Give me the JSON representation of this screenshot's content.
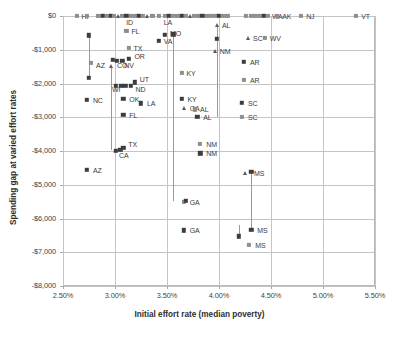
{
  "chart_data": {
    "type": "scatter",
    "title": "",
    "xlabel": "Initial effort rate (median poverty)",
    "ylabel": "Spending gap at varied effort rates",
    "xlim": [
      0.025,
      0.055
    ],
    "ylim": [
      -8000,
      0
    ],
    "xticks": [
      "2.50%",
      "3.00%",
      "3.50%",
      "4.00%",
      "4.50%",
      "5.00%",
      "5.50%"
    ],
    "xtick_values": [
      0.025,
      0.03,
      0.035,
      0.04,
      0.045,
      0.05,
      0.055
    ],
    "yticks": [
      "$0",
      "-$1,000",
      "-$2,000",
      "-$3,000",
      "-$4,000",
      "-$5,000",
      "-$6,000",
      "-$7,000",
      "-$8,000"
    ],
    "ytick_values": [
      0,
      -1000,
      -2000,
      -3000,
      -4000,
      -5000,
      -6000,
      -7000,
      -8000
    ],
    "grid": true,
    "legend": "none",
    "series": [
      {
        "name": "diamond-series",
        "marker": "diamond",
        "color": "#3d3d3d"
      },
      {
        "name": "square-series",
        "marker": "square",
        "color": "#8e8e8e"
      },
      {
        "name": "triangle-series",
        "marker": "triangle",
        "color": "#5a5a5a"
      }
    ],
    "points": [
      {
        "label": "HI",
        "x": 0.0263,
        "y": 0,
        "marker": "square",
        "lx": 5,
        "ly": 0
      },
      {
        "label": "",
        "x": 0.0273,
        "y": 0,
        "marker": "square"
      },
      {
        "label": "",
        "x": 0.0284,
        "y": 0,
        "marker": "square"
      },
      {
        "label": "",
        "x": 0.0288,
        "y": 0,
        "marker": "diamond"
      },
      {
        "label": "",
        "x": 0.0292,
        "y": 0,
        "marker": "square"
      },
      {
        "label": "",
        "x": 0.0296,
        "y": 0,
        "marker": "diamond"
      },
      {
        "label": "",
        "x": 0.0299,
        "y": 0,
        "marker": "square"
      },
      {
        "label": "",
        "x": 0.0303,
        "y": 0,
        "marker": "triangle"
      },
      {
        "label": "ID",
        "x": 0.0307,
        "y": 0,
        "marker": "square",
        "lx": 4,
        "ly": 6
      },
      {
        "label": "",
        "x": 0.0311,
        "y": 0,
        "marker": "diamond"
      },
      {
        "label": "",
        "x": 0.0315,
        "y": 0,
        "marker": "square"
      },
      {
        "label": "",
        "x": 0.0319,
        "y": 0,
        "marker": "square"
      },
      {
        "label": "",
        "x": 0.0323,
        "y": 0,
        "marker": "diamond"
      },
      {
        "label": "",
        "x": 0.0327,
        "y": 0,
        "marker": "square"
      },
      {
        "label": "",
        "x": 0.0331,
        "y": 0,
        "marker": "triangle"
      },
      {
        "label": "",
        "x": 0.0336,
        "y": 0,
        "marker": "square"
      },
      {
        "label": "LA",
        "x": 0.0342,
        "y": 0,
        "marker": "square",
        "lx": 5,
        "ly": 6
      },
      {
        "label": "",
        "x": 0.0348,
        "y": 0,
        "marker": "square"
      },
      {
        "label": "",
        "x": 0.0352,
        "y": 0,
        "marker": "diamond"
      },
      {
        "label": "",
        "x": 0.0356,
        "y": 0,
        "marker": "square"
      },
      {
        "label": "",
        "x": 0.036,
        "y": 0,
        "marker": "square"
      },
      {
        "label": "",
        "x": 0.0364,
        "y": 0,
        "marker": "diamond"
      },
      {
        "label": "",
        "x": 0.0368,
        "y": 0,
        "marker": "square"
      },
      {
        "label": "",
        "x": 0.0372,
        "y": 0,
        "marker": "triangle"
      },
      {
        "label": "",
        "x": 0.0376,
        "y": 0,
        "marker": "square"
      },
      {
        "label": "",
        "x": 0.038,
        "y": 0,
        "marker": "square"
      },
      {
        "label": "",
        "x": 0.0384,
        "y": 0,
        "marker": "diamond"
      },
      {
        "label": "",
        "x": 0.0388,
        "y": 0,
        "marker": "square"
      },
      {
        "label": "",
        "x": 0.0392,
        "y": 0,
        "marker": "square"
      },
      {
        "label": "",
        "x": 0.0396,
        "y": 0,
        "marker": "square"
      },
      {
        "label": "",
        "x": 0.04,
        "y": 0,
        "marker": "diamond"
      },
      {
        "label": "",
        "x": 0.0404,
        "y": 0,
        "marker": "square"
      },
      {
        "label": "",
        "x": 0.0408,
        "y": 0,
        "marker": "square"
      },
      {
        "label": "",
        "x": 0.0426,
        "y": 0,
        "marker": "square"
      },
      {
        "label": "",
        "x": 0.0431,
        "y": 0,
        "marker": "square"
      },
      {
        "label": "",
        "x": 0.0435,
        "y": 0,
        "marker": "square"
      },
      {
        "label": "",
        "x": 0.0439,
        "y": 0,
        "marker": "square"
      },
      {
        "label": "",
        "x": 0.0443,
        "y": 0,
        "marker": "diamond"
      },
      {
        "label": "WA",
        "x": 0.0447,
        "y": 0,
        "marker": "square",
        "lx": 4,
        "ly": 0
      },
      {
        "label": "AK",
        "x": 0.0456,
        "y": 0,
        "marker": "square",
        "lx": 5,
        "ly": 0
      },
      {
        "label": "NJ",
        "x": 0.0479,
        "y": 0,
        "marker": "square",
        "lx": 5,
        "ly": 0
      },
      {
        "label": "VT",
        "x": 0.0532,
        "y": 0,
        "marker": "square",
        "lx": 5,
        "ly": 0
      },
      {
        "label": "AL",
        "x": 0.0398,
        "y": -260,
        "marker": "triangle",
        "lx": 5,
        "ly": 0
      },
      {
        "label": "FL",
        "x": 0.0311,
        "y": -430,
        "marker": "square",
        "lx": 5,
        "ly": 0
      },
      {
        "label": "MO",
        "x": 0.0348,
        "y": -560,
        "marker": "diamond",
        "lx": 5,
        "ly": -2
      },
      {
        "label": "",
        "x": 0.0356,
        "y": -540,
        "marker": "diamond"
      },
      {
        "label": "",
        "x": 0.0275,
        "y": -570,
        "marker": "diamond"
      },
      {
        "label": "VA",
        "x": 0.0342,
        "y": -730,
        "marker": "diamond",
        "lx": 5,
        "ly": 0
      },
      {
        "label": "",
        "x": 0.0398,
        "y": -680,
        "marker": "diamond"
      },
      {
        "label": "SC",
        "x": 0.0428,
        "y": -660,
        "marker": "triangle",
        "lx": 5,
        "ly": 0
      },
      {
        "label": "WV",
        "x": 0.0444,
        "y": -650,
        "marker": "square",
        "lx": 5,
        "ly": 0
      },
      {
        "label": "TX",
        "x": 0.0313,
        "y": -950,
        "marker": "square",
        "lx": 5,
        "ly": 0
      },
      {
        "label": "NM",
        "x": 0.0396,
        "y": -1050,
        "marker": "triangle",
        "lx": 5,
        "ly": 0
      },
      {
        "label": "OR",
        "x": 0.0313,
        "y": -1270,
        "marker": "diamond",
        "lx": 6,
        "ly": -3
      },
      {
        "label": "CO",
        "x": 0.0302,
        "y": -1320,
        "marker": "diamond",
        "lx": 0,
        "ly": 4
      },
      {
        "label": "NV",
        "x": 0.0307,
        "y": -1320,
        "marker": "diamond",
        "lx": 2,
        "ly": 4
      },
      {
        "label": "",
        "x": 0.0298,
        "y": -1300,
        "marker": "diamond"
      },
      {
        "label": "AZ",
        "x": 0.0277,
        "y": -1400,
        "marker": "square",
        "lx": 5,
        "ly": 2
      },
      {
        "label": "",
        "x": 0.0296,
        "y": -1480,
        "marker": "triangle"
      },
      {
        "label": "AR",
        "x": 0.0424,
        "y": -1350,
        "marker": "diamond",
        "lx": 6,
        "ly": 0
      },
      {
        "label": "KY",
        "x": 0.0364,
        "y": -1680,
        "marker": "square",
        "lx": 5,
        "ly": 0
      },
      {
        "label": "AR",
        "x": 0.0424,
        "y": -1890,
        "marker": "square",
        "lx": 6,
        "ly": 0
      },
      {
        "label": "",
        "x": 0.0275,
        "y": -1830,
        "marker": "diamond"
      },
      {
        "label": "UT",
        "x": 0.0319,
        "y": -1970,
        "marker": "diamond",
        "lx": 5,
        "ly": -3
      },
      {
        "label": "ND",
        "x": 0.0315,
        "y": -2070,
        "marker": "diamond",
        "lx": 5,
        "ly": 3
      },
      {
        "label": "",
        "x": 0.031,
        "y": -2060,
        "marker": "diamond"
      },
      {
        "label": "",
        "x": 0.0306,
        "y": -2060,
        "marker": "diamond"
      },
      {
        "label": "WI",
        "x": 0.0301,
        "y": -2070,
        "marker": "diamond",
        "lx": -4,
        "ly": 3
      },
      {
        "label": "NC",
        "x": 0.0273,
        "y": -2490,
        "marker": "diamond",
        "lx": 6,
        "ly": 0
      },
      {
        "label": "OK",
        "x": 0.0308,
        "y": -2460,
        "marker": "diamond",
        "lx": 6,
        "ly": 0
      },
      {
        "label": "LA",
        "x": 0.0325,
        "y": -2590,
        "marker": "diamond",
        "lx": 6,
        "ly": 0
      },
      {
        "label": "KY",
        "x": 0.0364,
        "y": -2450,
        "marker": "diamond",
        "lx": 6,
        "ly": 0
      },
      {
        "label": "GA",
        "x": 0.0366,
        "y": -2720,
        "marker": "triangle",
        "lx": 6,
        "ly": 0
      },
      {
        "label": "AL",
        "x": 0.0377,
        "y": -2770,
        "marker": "square",
        "lx": 5,
        "ly": 0
      },
      {
        "label": "SC",
        "x": 0.0422,
        "y": -2570,
        "marker": "diamond",
        "lx": 6,
        "ly": 0
      },
      {
        "label": "FL",
        "x": 0.0308,
        "y": -2920,
        "marker": "diamond",
        "lx": 6,
        "ly": 0
      },
      {
        "label": "AL",
        "x": 0.0379,
        "y": -2980,
        "marker": "diamond",
        "lx": 6,
        "ly": 0
      },
      {
        "label": "SC",
        "x": 0.0422,
        "y": -3000,
        "marker": "square",
        "lx": 6,
        "ly": 0
      },
      {
        "label": "NM",
        "x": 0.0382,
        "y": -3800,
        "marker": "square",
        "lx": 6,
        "ly": 0
      },
      {
        "label": "TX",
        "x": 0.0308,
        "y": -3900,
        "marker": "diamond",
        "lx": 5,
        "ly": -4
      },
      {
        "label": "CA",
        "x": 0.0301,
        "y": -3990,
        "marker": "diamond",
        "lx": 3,
        "ly": 4
      },
      {
        "label": "",
        "x": 0.0305,
        "y": -3960,
        "marker": "diamond"
      },
      {
        "label": "NM",
        "x": 0.0382,
        "y": -4070,
        "marker": "diamond",
        "lx": 6,
        "ly": 0
      },
      {
        "label": "AZ",
        "x": 0.0273,
        "y": -4550,
        "marker": "diamond",
        "lx": 6,
        "ly": 0
      },
      {
        "label": "MS",
        "x": 0.0425,
        "y": -4650,
        "marker": "triangle",
        "lx": 9,
        "ly": 0
      },
      {
        "label": "",
        "x": 0.0431,
        "y": -4620,
        "marker": "diamond"
      },
      {
        "label": "GA",
        "x": 0.0366,
        "y": -5500,
        "marker": "square",
        "lx": 6,
        "ly": 0
      },
      {
        "label": "",
        "x": 0.0368,
        "y": -5470,
        "marker": "diamond"
      },
      {
        "label": "GA",
        "x": 0.0366,
        "y": -6350,
        "marker": "diamond",
        "lx": 6,
        "ly": 0
      },
      {
        "label": "MS",
        "x": 0.0431,
        "y": -6330,
        "marker": "diamond",
        "lx": 6,
        "ly": 0
      },
      {
        "label": "",
        "x": 0.0419,
        "y": -6530,
        "marker": "diamond"
      },
      {
        "label": "MS",
        "x": 0.0429,
        "y": -6790,
        "marker": "square",
        "lx": 6,
        "ly": 0
      }
    ],
    "connectors": [
      {
        "x": 0.0275,
        "y1": -570,
        "y2": -1830
      },
      {
        "x": 0.0296,
        "y1": -1480,
        "y2": -3960
      },
      {
        "x": 0.0356,
        "y1": -540,
        "y2": -5470
      },
      {
        "x": 0.0398,
        "y1": -260,
        "y2": -2980
      },
      {
        "x": 0.0431,
        "y1": -4620,
        "y2": -6330
      },
      {
        "x": 0.0419,
        "y1": -6180,
        "y2": -6530
      }
    ]
  }
}
